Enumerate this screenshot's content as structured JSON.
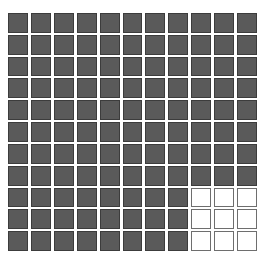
{
  "chart_data": {
    "type": "waffle",
    "rows": 11,
    "columns": 11,
    "total_cells": 121,
    "filled_cells": 112,
    "empty_cells": 9,
    "empty_region": {
      "rows": [
        9,
        10,
        11
      ],
      "columns": [
        9,
        10,
        11
      ]
    },
    "title": "",
    "xlabel": "",
    "ylabel": "",
    "legend": []
  },
  "colors": {
    "filled": "#5a5a5a",
    "empty": "#ffffff",
    "border": "#3c3c3c"
  }
}
